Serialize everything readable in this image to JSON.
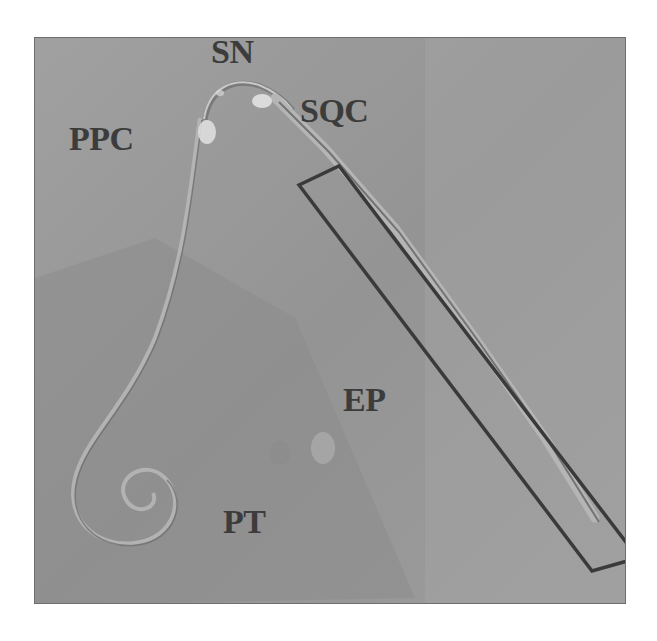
{
  "figure": {
    "labels": {
      "sn": "SN",
      "ppc": "PPC",
      "sqc": "SQC",
      "ep": "EP",
      "pt": "PT"
    },
    "colors": {
      "background": "#9a9a9a",
      "label": "#3c3c3c",
      "box_outline": "#3a3a3a"
    }
  }
}
